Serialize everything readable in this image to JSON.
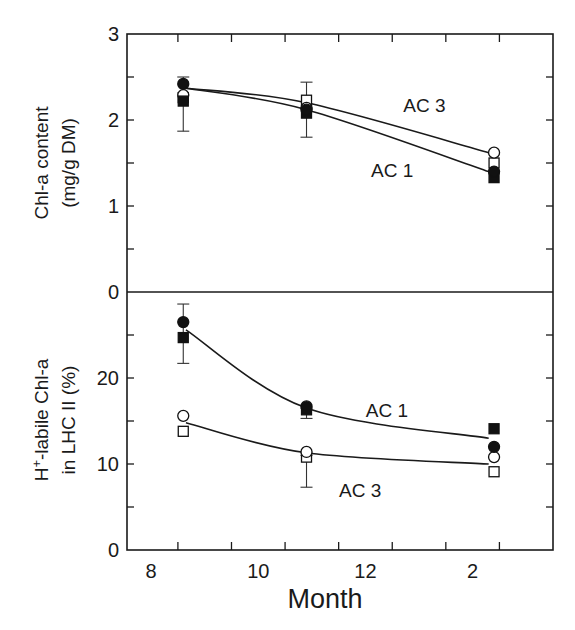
{
  "chart_data": {
    "type": "line",
    "xlabel": "Month",
    "x_tick_labels": [
      {
        "value": 8,
        "label": "8"
      },
      {
        "value": 10,
        "label": "10"
      },
      {
        "value": 12,
        "label": "12"
      },
      {
        "value": 14,
        "label": "2"
      }
    ],
    "x_minor_ticks": [
      8.5,
      9.5,
      10.5,
      11.5,
      12.5,
      13.5,
      14.5
    ],
    "xlim": [
      7.55,
      15.5
    ],
    "panels": [
      {
        "id": "top",
        "ylabel_line1": "Chl-a content",
        "ylabel_line2": "(mg/g DM)",
        "ylim": [
          0,
          3
        ],
        "y_tick_labels": [
          {
            "value": 3,
            "label": "3"
          },
          {
            "value": 2,
            "label": "2"
          },
          {
            "value": 1,
            "label": "1"
          },
          {
            "value": 0,
            "label": "0"
          }
        ],
        "y_minor_ticks": [
          0.5,
          1.5,
          2.5
        ],
        "markers": [
          {
            "x": 8.6,
            "series": "AC 1",
            "shape": "filled-circle",
            "y": 2.42
          },
          {
            "x": 8.6,
            "series": "AC 3",
            "shape": "open-circle",
            "y": 2.29
          },
          {
            "x": 8.6,
            "series": "AC 3",
            "shape": "open-square",
            "y": 2.26
          },
          {
            "x": 8.6,
            "series": "AC 1",
            "shape": "filled-square",
            "y": 2.22
          },
          {
            "x": 10.9,
            "series": "AC 3",
            "shape": "open-square",
            "y": 2.23
          },
          {
            "x": 10.9,
            "series": "AC 3",
            "shape": "open-circle",
            "y": 2.14
          },
          {
            "x": 10.9,
            "series": "AC 1",
            "shape": "filled-circle",
            "y": 2.12
          },
          {
            "x": 10.9,
            "series": "AC 1",
            "shape": "filled-square",
            "y": 2.08
          },
          {
            "x": 14.4,
            "series": "AC 3",
            "shape": "open-circle",
            "y": 1.62
          },
          {
            "x": 14.4,
            "series": "AC 3",
            "shape": "open-square",
            "y": 1.5
          },
          {
            "x": 14.4,
            "series": "AC 1",
            "shape": "filled-circle",
            "y": 1.4
          },
          {
            "x": 14.4,
            "series": "AC 1",
            "shape": "filled-square",
            "y": 1.33
          }
        ],
        "error_bars": [
          {
            "x": 8.6,
            "low": 1.87,
            "high": 2.5
          },
          {
            "x": 10.9,
            "low": 1.8,
            "high": 2.44
          }
        ],
        "fit_curves": [
          {
            "name": "AC 3",
            "points": [
              [
                8.65,
                2.37
              ],
              [
                10.9,
                2.2
              ],
              [
                14.3,
                1.62
              ]
            ]
          },
          {
            "name": "AC 1",
            "points": [
              [
                8.65,
                2.37
              ],
              [
                10.9,
                2.12
              ],
              [
                14.3,
                1.4
              ]
            ]
          }
        ],
        "curve_labels": [
          {
            "text": "AC 3",
            "x": 13.1,
            "y": 2.17
          },
          {
            "text": "AC 1",
            "x": 12.5,
            "y": 1.42
          }
        ]
      },
      {
        "id": "bottom",
        "ylabel_line1": "H+-labile Chl-a",
        "ylabel_sup": "+",
        "ylabel_base": "H",
        "ylabel_rest": "-labile Chl-a",
        "ylabel_line2": "in LHC II (%)",
        "ylim": [
          0,
          30
        ],
        "y_tick_labels": [
          {
            "value": 20,
            "label": "20"
          },
          {
            "value": 10,
            "label": "10"
          },
          {
            "value": 0,
            "label": "0"
          }
        ],
        "y_minor_ticks": [
          5,
          15,
          25
        ],
        "markers": [
          {
            "x": 8.6,
            "series": "AC 1",
            "shape": "filled-circle",
            "y": 26.5
          },
          {
            "x": 8.6,
            "series": "AC 1",
            "shape": "filled-square",
            "y": 24.7
          },
          {
            "x": 8.6,
            "series": "AC 3",
            "shape": "open-circle",
            "y": 15.6
          },
          {
            "x": 8.6,
            "series": "AC 3",
            "shape": "open-square",
            "y": 13.8
          },
          {
            "x": 10.9,
            "series": "AC 1",
            "shape": "filled-circle",
            "y": 16.7
          },
          {
            "x": 10.9,
            "series": "AC 1",
            "shape": "filled-square",
            "y": 16.3
          },
          {
            "x": 10.9,
            "series": "AC 3",
            "shape": "open-circle",
            "y": 11.4
          },
          {
            "x": 10.9,
            "series": "AC 3",
            "shape": "open-square",
            "y": 10.8
          },
          {
            "x": 14.4,
            "series": "AC 1",
            "shape": "filled-square",
            "y": 14.1
          },
          {
            "x": 14.4,
            "series": "AC 1",
            "shape": "filled-circle",
            "y": 12.0
          },
          {
            "x": 14.4,
            "series": "AC 3",
            "shape": "open-circle",
            "y": 10.8
          },
          {
            "x": 14.4,
            "series": "AC 3",
            "shape": "open-square",
            "y": 9.1
          }
        ],
        "error_bars": [
          {
            "x": 8.6,
            "low": 21.7,
            "high": 28.6
          },
          {
            "x": 10.9,
            "low": 15.3,
            "high": 16.5
          },
          {
            "x": 10.9,
            "low": 7.3,
            "high": 11.0
          }
        ],
        "fit_curves": [
          {
            "name": "AC 1",
            "points": [
              [
                8.65,
                25.6
              ],
              [
                10.9,
                16.5
              ],
              [
                14.3,
                13.0
              ]
            ]
          },
          {
            "name": "AC 3",
            "points": [
              [
                8.65,
                14.8
              ],
              [
                10.9,
                11.3
              ],
              [
                14.3,
                10.0
              ]
            ]
          }
        ],
        "curve_labels": [
          {
            "text": "AC 1",
            "x": 12.4,
            "y": 16.3
          },
          {
            "text": "AC 3",
            "x": 11.9,
            "y": 7.0
          }
        ]
      }
    ],
    "series": [
      {
        "name": "AC 1",
        "markers": [
          "filled-circle",
          "filled-square"
        ]
      },
      {
        "name": "AC 3",
        "markers": [
          "open-circle",
          "open-square"
        ]
      }
    ],
    "grid": false,
    "legend": "none (inline curve labels)"
  },
  "labels": {
    "x_title": "Month",
    "top_ylabel_1": "Chl-a content",
    "top_ylabel_2": "(mg/g DM)",
    "bottom_ylabel_base": "H",
    "bottom_ylabel_sup": "+",
    "bottom_ylabel_rest": "-labile Chl-a",
    "bottom_ylabel_2": "in LHC II (%)"
  }
}
